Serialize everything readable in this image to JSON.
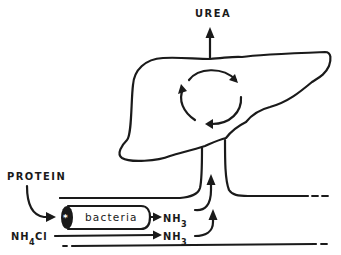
{
  "diagram": {
    "labels": {
      "urea": "UREA",
      "protein": "PROTEIN",
      "bacteria": "bacteria",
      "nh3_top": "NH",
      "nh3_top_sub": "3",
      "nh3_bottom": "NH",
      "nh3_bottom_sub": "3",
      "nh4cl": "NH",
      "nh4cl_sub": "4",
      "nh4cl_suffix": "Cl"
    },
    "nodes": [
      {
        "id": "liver",
        "label": "liver (urea cycle)"
      },
      {
        "id": "portal-vein",
        "label": "portal vein"
      },
      {
        "id": "intestine",
        "label": "intestine"
      },
      {
        "id": "bacteria",
        "label": "bacteria"
      }
    ],
    "edges": [
      {
        "from": "PROTEIN",
        "to": "bacteria"
      },
      {
        "from": "bacteria",
        "to": "NH3"
      },
      {
        "from": "NH4Cl",
        "to": "NH3"
      },
      {
        "from": "NH3",
        "to": "portal-vein"
      },
      {
        "from": "liver",
        "to": "UREA"
      }
    ],
    "colors": {
      "ink": "#1a1a1a",
      "background": "#ffffff"
    }
  }
}
